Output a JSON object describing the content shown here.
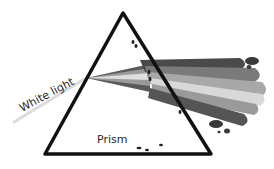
{
  "diagram": {
    "labels": {
      "incoming": "White light",
      "prism": "Prism"
    },
    "beam_bands": [
      {
        "name": "band-1",
        "color": "#4a4a4a"
      },
      {
        "name": "band-2",
        "color": "#7a7a7a"
      },
      {
        "name": "band-3",
        "color": "#a8a8a8"
      },
      {
        "name": "band-4",
        "color": "#d8d8d8"
      },
      {
        "name": "band-5",
        "color": "#9a9a9a"
      },
      {
        "name": "band-6",
        "color": "#555555"
      }
    ],
    "colors": {
      "prism_outline": "#111111",
      "white_light": "#dcdcdc",
      "background": "#ffffff"
    }
  }
}
